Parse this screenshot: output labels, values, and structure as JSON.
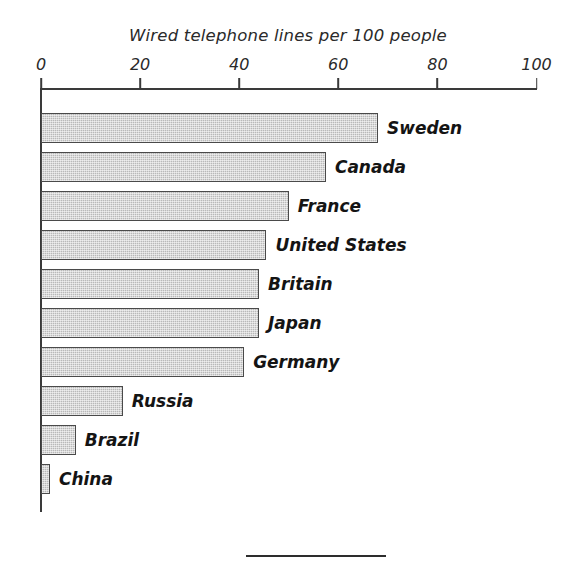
{
  "chart_data": {
    "type": "bar",
    "orientation": "horizontal",
    "title": "Wired telephone lines per 100 people",
    "xlabel": "",
    "ylabel": "",
    "xlim": [
      0,
      100
    ],
    "ticks": [
      0,
      20,
      40,
      60,
      80,
      100
    ],
    "tick_labels": [
      "0",
      "20",
      "40",
      "60",
      "80",
      "100"
    ],
    "grid": false,
    "legend": null,
    "categories": [
      "Sweden",
      "Canada",
      "France",
      "United States",
      "Britain",
      "Japan",
      "Germany",
      "Russia",
      "Brazil",
      "China"
    ],
    "values": [
      68,
      57.5,
      50,
      45.5,
      44,
      44,
      41,
      16.5,
      7,
      1.8
    ],
    "bar_color": "#b9b9b9",
    "bar_edge_color": "#4a4a4a",
    "axis_color": "#3a3a3a",
    "background": "#ffffff"
  },
  "footer": {
    "rule": "horizontal-rule"
  }
}
